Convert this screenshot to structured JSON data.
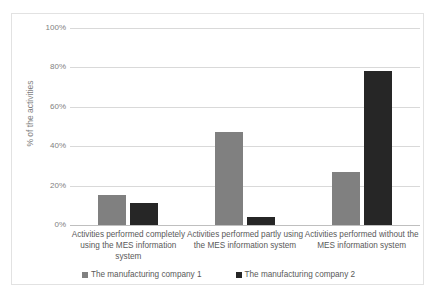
{
  "chart_data": {
    "type": "bar",
    "title": "",
    "xlabel": "",
    "ylabel": "% of the activities",
    "ylim": [
      0,
      100
    ],
    "ytick_labels": [
      "0%",
      "20%",
      "40%",
      "60%",
      "80%",
      "100%"
    ],
    "ytick_values": [
      0,
      20,
      40,
      60,
      80,
      100
    ],
    "grid": true,
    "legend_position": "bottom",
    "categories": [
      "Activities performed completely using the MES information system",
      "Activities performed partly using the MES information system",
      "Activities performed without the MES information system"
    ],
    "series": [
      {
        "name": "The manufacturing company 1",
        "color": "#808080",
        "values": [
          15,
          47,
          27
        ]
      },
      {
        "name": "The manufacturing company 2",
        "color": "#262626",
        "values": [
          11,
          4,
          78
        ]
      }
    ]
  },
  "axis": {
    "y_title": "% of the activities"
  },
  "legend": {
    "items": [
      {
        "label": "The manufacturing company 1",
        "color": "#808080"
      },
      {
        "label": "The manufacturing company 2",
        "color": "#262626"
      }
    ]
  }
}
